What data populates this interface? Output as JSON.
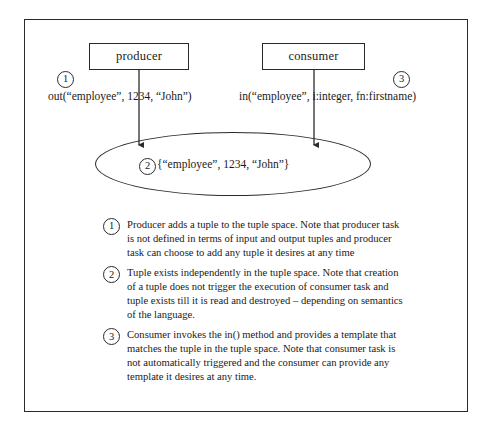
{
  "figure": {
    "tasks": {
      "producer": "producer",
      "consumer": "consumer"
    },
    "markers": {
      "one": "1",
      "two": "2",
      "three": "3"
    },
    "operations": {
      "out_call": "out(“employee”, 1234, “John”)",
      "in_call": "in(“employee”, i:integer, fn:firstname)"
    },
    "tuple_space": {
      "tuple": "{“employee”, 1234, “John”}"
    },
    "notes": [
      {
        "marker": "1",
        "text": "Producer adds a tuple to the tuple space. Note that producer task is not defined in terms of input and output tuples and producer task can choose to add any tuple it desires at any time"
      },
      {
        "marker": "2",
        "text": "Tuple exists independently in the tuple space. Note that creation of a tuple does not trigger the execution of consumer task and tuple exists till it is read and destroyed – depending on semantics of the language."
      },
      {
        "marker": "3",
        "text": "Consumer invokes the in() method and provides a template that matches the tuple in the tuple space. Note that consumer task is not automatically triggered and the consumer can provide any template it desires at any time."
      }
    ],
    "colors": {
      "ink": "#2b2b2b",
      "page": "#ffffff"
    }
  }
}
